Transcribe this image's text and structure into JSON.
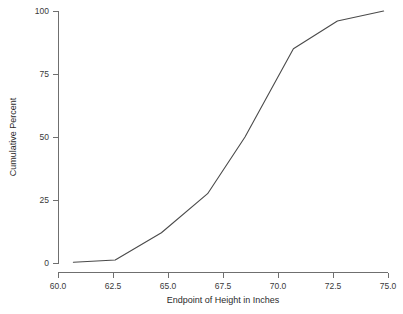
{
  "chart_data": {
    "type": "line",
    "title": "",
    "xlabel": "Endpoint of Height in Inches",
    "ylabel": "Cumulative Percent",
    "xlim": [
      60.0,
      75.0
    ],
    "ylim": [
      0,
      100
    ],
    "grid": false,
    "legend": null,
    "xticks": [
      "60.0",
      "62.5",
      "65.0",
      "67.5",
      "70.0",
      "72.5",
      "75.0"
    ],
    "xtick_values": [
      60.0,
      62.5,
      65.0,
      67.5,
      70.0,
      72.5,
      75.0
    ],
    "yticks": [
      "0",
      "25",
      "50",
      "75",
      "100"
    ],
    "ytick_values": [
      0,
      25,
      50,
      75,
      100
    ],
    "x": [
      60.7,
      62.6,
      64.7,
      66.8,
      68.5,
      70.7,
      72.7,
      74.8
    ],
    "values": [
      0.3,
      1.2,
      12.0,
      27.5,
      50.0,
      85.0,
      96.0,
      100.0
    ],
    "series": [
      {
        "name": "Cumulative Percent",
        "color": "#4a4a4a",
        "points": [
          {
            "x": 60.7,
            "y": 0.3
          },
          {
            "x": 62.6,
            "y": 1.2
          },
          {
            "x": 64.7,
            "y": 12.0
          },
          {
            "x": 66.8,
            "y": 27.5
          },
          {
            "x": 68.5,
            "y": 50.0
          },
          {
            "x": 70.7,
            "y": 85.0
          },
          {
            "x": 72.7,
            "y": 96.0
          },
          {
            "x": 74.8,
            "y": 100.0
          }
        ]
      }
    ]
  },
  "axes": {
    "x_label": "Endpoint of Height in Inches",
    "y_label": "Cumulative Percent"
  },
  "colors": {
    "line": "#4a4a4a",
    "axis": "#6f6f6f",
    "text": "#2b2b2b",
    "background": "#ffffff"
  }
}
